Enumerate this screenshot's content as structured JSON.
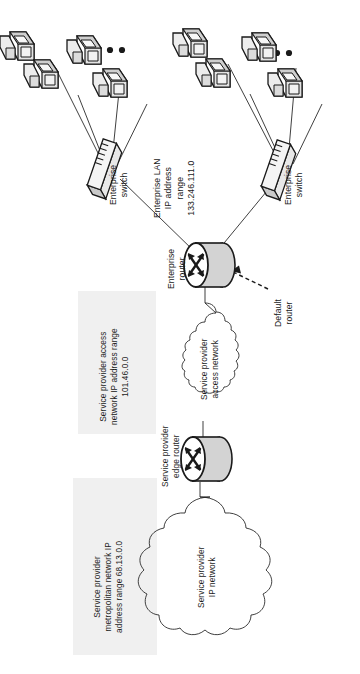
{
  "diagram": {
    "orientation": "rotated-90-ccw",
    "background_color": "#ffffff",
    "region_fill_color": "#f0f0f0",
    "line_color": "#1d1d1d"
  },
  "labels": {
    "enterprise_switch_left": "Enterprise\nswitch",
    "enterprise_switch_right": "Enterprise\nswitch",
    "enterprise_lan": "Enterprise LAN\nIP address\nrange\n133.246.111.0",
    "enterprise_router": "Enterprise\nrouter",
    "default_router": "Default\nrouter",
    "sp_access_region": "Service provider access\nnetwork IP address range\n101.46.0.0",
    "sp_access_cloud": "Service provider\naccess network",
    "sp_edge_router": "Service provider\nedge router",
    "sp_metro_region": "Service provider\nmetropolitan network IP\naddress range 68.13.0.0",
    "sp_ip_cloud": "Service provider\nIP network"
  },
  "nodes": [
    {
      "name": "workstation",
      "icon": "workstation-icon",
      "group": "left-lan",
      "count": 4
    },
    {
      "name": "workstation",
      "icon": "workstation-icon",
      "group": "right-lan",
      "count": 4
    },
    {
      "name": "enterprise-switch",
      "icon": "switch-icon",
      "group": "left-lan"
    },
    {
      "name": "enterprise-switch",
      "icon": "switch-icon",
      "group": "right-lan"
    },
    {
      "name": "enterprise-router",
      "icon": "router-icon"
    },
    {
      "name": "service-provider-edge-router",
      "icon": "router-icon"
    },
    {
      "name": "service-provider-access-network",
      "icon": "cloud-icon"
    },
    {
      "name": "service-provider-ip-network",
      "icon": "cloud-icon"
    }
  ],
  "ellipsis": "• • •"
}
